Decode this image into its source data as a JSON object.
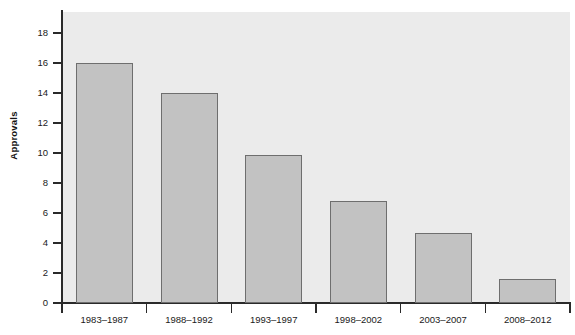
{
  "chart_data": {
    "type": "bar",
    "title": "",
    "xlabel": "",
    "ylabel": "Approvals",
    "categories": [
      "1983–1987",
      "1988–1992",
      "1993–1997",
      "1998–2002",
      "2003–2007",
      "2008–2012"
    ],
    "values": [
      16.0,
      14.0,
      9.9,
      6.8,
      4.7,
      1.6
    ],
    "ylim": [
      0,
      19.4
    ],
    "y_ticks": [
      0,
      2,
      4,
      6,
      8,
      10,
      12,
      14,
      16,
      18
    ],
    "y_tick_labels": [
      "0",
      "2",
      "4",
      "6",
      "8",
      "10",
      "12",
      "14",
      "16",
      "18"
    ],
    "grid": false,
    "legend": null,
    "legend_position": "none",
    "colors": {
      "bar_fill": "#c2c2c2",
      "bar_edge": "#6e6e6e",
      "panel_background": "#ebebeb",
      "axis": "#2a2a2a",
      "text": "#1a1a1a",
      "figure_background": "#ffffff"
    }
  }
}
